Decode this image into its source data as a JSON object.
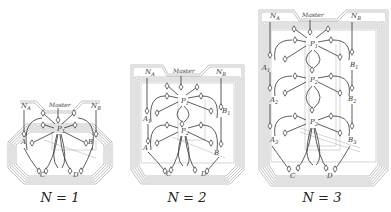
{
  "figure": {
    "panels": [
      {
        "id": "n1",
        "caption": "N = 1",
        "labels": {
          "na": "N",
          "na_sub": "A",
          "master": "Master",
          "nb": "N",
          "nb_sub": "B",
          "p1": "P",
          "p1_sub": "1",
          "a": "A",
          "b": "B",
          "c": "C",
          "d": "D"
        }
      },
      {
        "id": "n2",
        "caption": "N = 2",
        "labels": {
          "na": "N",
          "na_sub": "A",
          "master": "Master",
          "nb": "N",
          "nb_sub": "B",
          "p1": "P",
          "p1_sub": "1",
          "p2": "P",
          "p2_sub": "2",
          "a1": "A",
          "a1_sub": "1",
          "b1": "B",
          "b1_sub": "1",
          "a": "A",
          "b": "B",
          "c": "C",
          "d": "D"
        }
      },
      {
        "id": "n3",
        "caption": "N = 3",
        "labels": {
          "na": "N",
          "na_sub": "A",
          "master": "Master",
          "nb": "N",
          "nb_sub": "B",
          "p1": "P",
          "p1_sub": "1",
          "p2": "P",
          "p2_sub": "2",
          "p3": "P",
          "p3_sub": "3",
          "a1": "A",
          "a1_sub": "1",
          "b1": "B",
          "b1_sub": "1",
          "a2": "A",
          "a2_sub": "2",
          "b2": "B",
          "b2_sub": "2",
          "a3": "A",
          "a3_sub": "3",
          "b3": "B",
          "b3_sub": "3",
          "c": "C",
          "d": "D"
        }
      }
    ]
  }
}
